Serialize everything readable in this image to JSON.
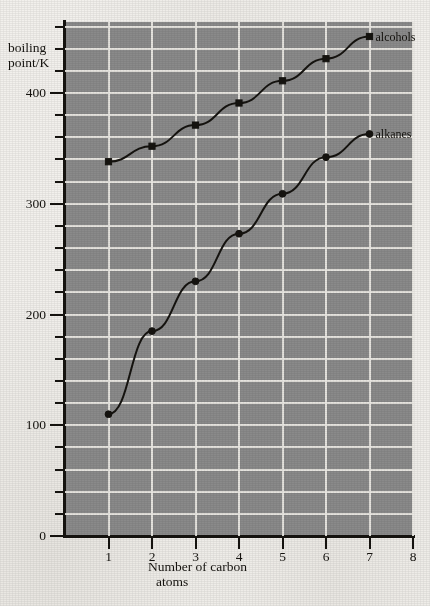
{
  "chart_data": {
    "type": "line",
    "title": "",
    "xlabel": "Number of carbon atoms",
    "ylabel": "boiling point/K",
    "x": [
      1,
      2,
      3,
      4,
      5,
      6,
      7
    ],
    "xlim": [
      0,
      8
    ],
    "ylim": [
      0,
      460
    ],
    "grid": true,
    "legend_position": "inline-right-end-of-series",
    "x_ticks": [
      "1",
      "2",
      "3",
      "4",
      "5",
      "6",
      "7",
      "8"
    ],
    "y_ticks": [
      "0",
      "100",
      "200",
      "300",
      "400"
    ],
    "y_tick_minor_step": 20,
    "series": [
      {
        "name": "alcohols",
        "values": [
          338,
          352,
          371,
          391,
          411,
          431,
          451
        ],
        "marker": "filled-square",
        "color": "#15130f"
      },
      {
        "name": "alkanes",
        "values": [
          110,
          185,
          230,
          273,
          309,
          342,
          363
        ],
        "marker": "filled-circle",
        "color": "#15130f"
      }
    ],
    "annotations": [
      {
        "text": "alcohols",
        "at_x": 7,
        "at_y": 451
      },
      {
        "text": "alkanes",
        "at_x": 7,
        "at_y": 363
      }
    ]
  },
  "figure": {
    "axis_title_y_line1": "boiling",
    "axis_title_y_line2": "point/K",
    "axis_title_x_line1": "Number of carbon",
    "axis_title_x_line2": "atoms",
    "plot_background_color": "#8a8a8a",
    "gridline_color": "#eceae4",
    "ink_color": "#15130f",
    "paper_color": "#f2f0ec"
  }
}
